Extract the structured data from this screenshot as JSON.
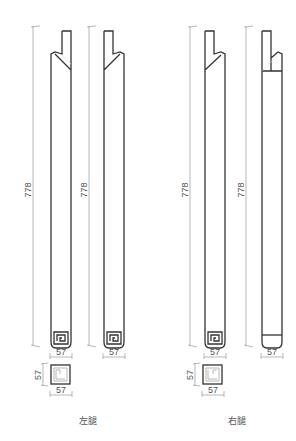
{
  "drawing": {
    "groups": [
      {
        "caption": "左腿",
        "elevations": [
          {
            "height_label": "778",
            "width_label": "57",
            "end_type": "spiral-scroll-foot",
            "shoulder": "down-right"
          },
          {
            "height_label": "778",
            "width_label": "57",
            "end_type": "spiral-scroll-foot",
            "shoulder": "down-left"
          }
        ],
        "section": {
          "height_label": "57",
          "width_label": "57"
        }
      },
      {
        "caption": "右腿",
        "elevations": [
          {
            "height_label": "778",
            "width_label": "57",
            "end_type": "spiral-scroll-foot",
            "shoulder": "down-left"
          },
          {
            "height_label": "778",
            "width_label": "57",
            "end_type": "rounded-plain-foot",
            "shoulder": "square-with-tenon"
          }
        ],
        "section": {
          "height_label": "57",
          "width_label": "57"
        }
      }
    ],
    "colors": {
      "line": "#333333",
      "dimension": "#999999",
      "text": "#555555",
      "background": "#ffffff"
    }
  }
}
